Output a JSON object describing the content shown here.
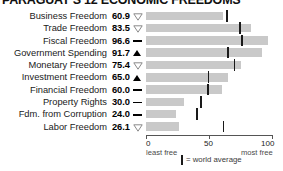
{
  "title": "PARAGUAY'S 12 ECONOMIC FREEDOMS",
  "axis": {
    "tick_labels": [
      "0",
      "50",
      "100"
    ],
    "tick_values": [
      0,
      50,
      100
    ],
    "left_caption": "least free",
    "right_caption": "most free"
  },
  "legend": {
    "marker": "|",
    "text": "= world average"
  },
  "colors": {
    "bar": "#c9c9c9",
    "world_average_marker": "#1a1a1a",
    "axis": "#555555",
    "text": "#1a1a1a"
  },
  "chart_data": {
    "type": "bar",
    "title": "PARAGUAY'S 12 ECONOMIC FREEDOMS",
    "xlabel": "",
    "ylabel": "",
    "xlim": [
      0,
      100
    ],
    "grid": false,
    "orientation": "horizontal",
    "legend_position": "bottom",
    "categories": [
      "Business Freedom",
      "Trade Freedom",
      "Fiscal Freedom",
      "Government Spending",
      "Monetary Freedom",
      "Investment Freedom",
      "Financial Freedom",
      "Property Rights",
      "Fdm. from Corruption",
      "Labor Freedom"
    ],
    "values": [
      60.9,
      83.5,
      96.6,
      91.7,
      75.4,
      65.0,
      60.0,
      30.0,
      24.0,
      26.1
    ],
    "value_labels": [
      "60.9",
      "83.5",
      "96.6",
      "91.7",
      "75.4",
      "65.0",
      "60.0",
      "30.0",
      "24.0",
      "26.1"
    ],
    "trends": [
      "down",
      "down",
      "flat",
      "up",
      "down",
      "up",
      "flat",
      "flat",
      "flat",
      "down"
    ],
    "trend_glyphs": [
      "▽",
      "▽",
      "—",
      "▲",
      "▽",
      "▲",
      "—",
      "—",
      "—",
      "▽"
    ],
    "series": [
      {
        "name": "Paraguay score",
        "values": [
          60.9,
          83.5,
          96.6,
          91.7,
          75.4,
          65.0,
          60.0,
          30.0,
          24.0,
          26.1
        ]
      },
      {
        "name": "world average",
        "values": [
          64.3,
          74.8,
          76.2,
          64.9,
          70.4,
          49.5,
          49.0,
          43.6,
          40.5,
          61.5
        ]
      }
    ]
  }
}
